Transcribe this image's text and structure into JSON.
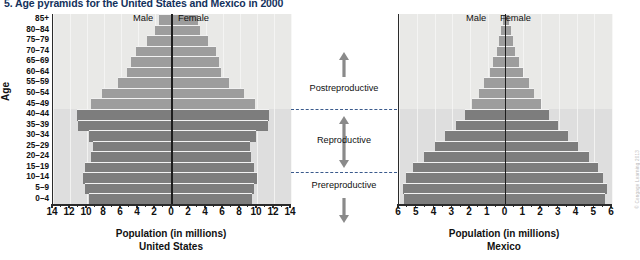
{
  "figure": {
    "title": "5. Age pyramids for the United States and Mexico in 2000",
    "y_axis_title": "Age",
    "credit": "© Cengage Learning 2013"
  },
  "annotations": {
    "postreproductive": "Postreproductive",
    "reproductive": "Reproductive",
    "prereproductive": "Prereproductive"
  },
  "panels": {
    "us": {
      "male_label": "Male",
      "female_label": "Female",
      "caption_line1": "Population (in millions)",
      "caption_line2": "United States"
    },
    "mx": {
      "male_label": "Male",
      "female_label": "Female",
      "caption_line1": "Population (in millions)",
      "caption_line2": "Mexico"
    }
  },
  "chart_data": {
    "type": "bar",
    "title": "5. Age pyramids for the United States and Mexico in 2000",
    "subtype": "population-pyramid",
    "xlabel": "Population (in millions)",
    "ylabel": "Age",
    "grid": true,
    "legend_position": "top-center",
    "age_groups": [
      "85+",
      "80–84",
      "75–79",
      "70–74",
      "65–69",
      "60–64",
      "55–59",
      "50–54",
      "45–49",
      "40–44",
      "35–39",
      "30–34",
      "25–29",
      "20–24",
      "15–19",
      "10–14",
      "5–9",
      "0–4"
    ],
    "zones": {
      "postreproductive": [
        "45–49",
        "50–54",
        "55–59",
        "60–64",
        "65–69",
        "70–74",
        "75–79",
        "80–84",
        "85+"
      ],
      "reproductive": [
        "15–19",
        "20–24",
        "25–29",
        "30–34",
        "35–39",
        "40–44"
      ],
      "prereproductive": [
        "0–4",
        "5–9",
        "10–14"
      ]
    },
    "charts": [
      {
        "name": "United States",
        "xlim": [
          0,
          14
        ],
        "xticks": [
          14,
          12,
          10,
          8,
          6,
          4,
          2,
          0,
          2,
          4,
          6,
          8,
          10,
          12,
          14
        ],
        "series": [
          {
            "name": "Male",
            "values": [
              1.5,
              2.0,
              3.0,
              4.2,
              4.8,
              5.3,
              6.3,
              8.2,
              9.5,
              11.2,
              11.1,
              9.8,
              9.3,
              9.5,
              10.2,
              10.5,
              10.2,
              9.8
            ]
          },
          {
            "name": "Female",
            "values": [
              3.0,
              3.3,
              4.2,
              5.2,
              5.5,
              5.8,
              6.7,
              8.5,
              9.8,
              11.4,
              11.3,
              9.9,
              9.2,
              9.3,
              9.7,
              10.0,
              9.7,
              9.4
            ]
          }
        ]
      },
      {
        "name": "Mexico",
        "xlim": [
          0,
          6
        ],
        "xticks": [
          6,
          5,
          4,
          3,
          2,
          1,
          0,
          1,
          2,
          3,
          4,
          5,
          6
        ],
        "series": [
          {
            "name": "Male",
            "values": [
              0.15,
              0.25,
              0.35,
              0.5,
              0.7,
              0.9,
              1.2,
              1.5,
              1.9,
              2.3,
              2.8,
              3.4,
              4.0,
              4.6,
              5.2,
              5.6,
              5.8,
              5.7
            ]
          },
          {
            "name": "Female",
            "values": [
              0.2,
              0.3,
              0.4,
              0.55,
              0.75,
              1.0,
              1.3,
              1.6,
              2.0,
              2.45,
              2.95,
              3.5,
              4.1,
              4.7,
              5.2,
              5.5,
              5.7,
              5.6
            ]
          }
        ]
      }
    ]
  }
}
